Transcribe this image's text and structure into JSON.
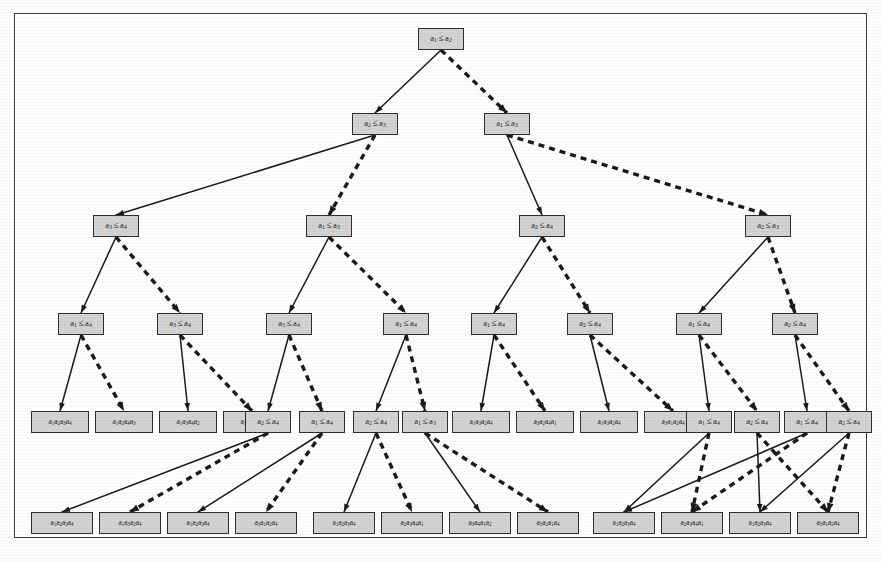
{
  "figure": {
    "type": "sorting-decision-tree",
    "element_symbol": "a",
    "colors": {
      "node_fill": "#d2d2d2",
      "node_border": "#2e2e2e",
      "edge_solid": "#1a1a1a",
      "edge_dashed": "#1a1a1a",
      "frame": "#3a3a3a",
      "page": "#fefefe"
    },
    "edge_legend": {
      "solid": "comparison true (yes) branch",
      "dashed": "comparison false (no) branch"
    },
    "levels": 6
  },
  "nodes": [
    {
      "id": "n0",
      "kind": "decision",
      "level": 0,
      "x": 418,
      "y": 28,
      "w": 46,
      "h": 22,
      "left": "a",
      "li": "1",
      "right": "a",
      "ri": "2"
    },
    {
      "id": "n1",
      "kind": "decision",
      "level": 1,
      "x": 352,
      "y": 113,
      "w": 46,
      "h": 22,
      "left": "a",
      "li": "2",
      "right": "a",
      "ri": "3"
    },
    {
      "id": "n2",
      "kind": "decision",
      "level": 1,
      "x": 484,
      "y": 113,
      "w": 46,
      "h": 22,
      "left": "a",
      "li": "1",
      "right": "a",
      "ri": "3"
    },
    {
      "id": "n3",
      "kind": "decision",
      "level": 2,
      "x": 93,
      "y": 215,
      "w": 46,
      "h": 22,
      "left": "a",
      "li": "3",
      "right": "a",
      "ri": "4"
    },
    {
      "id": "n4",
      "kind": "decision",
      "level": 2,
      "x": 306,
      "y": 215,
      "w": 46,
      "h": 22,
      "left": "a",
      "li": "1",
      "right": "a",
      "ri": "3"
    },
    {
      "id": "n5",
      "kind": "decision",
      "level": 2,
      "x": 519,
      "y": 215,
      "w": 46,
      "h": 22,
      "left": "a",
      "li": "2",
      "right": "a",
      "ri": "4"
    },
    {
      "id": "n6",
      "kind": "decision",
      "level": 2,
      "x": 745,
      "y": 215,
      "w": 46,
      "h": 22,
      "left": "a",
      "li": "2",
      "right": "a",
      "ri": "3"
    },
    {
      "id": "n7",
      "kind": "decision",
      "level": 3,
      "x": 58,
      "y": 313,
      "w": 46,
      "h": 22,
      "left": "a",
      "li": "1",
      "right": "a",
      "ri": "4"
    },
    {
      "id": "n8",
      "kind": "decision",
      "level": 3,
      "x": 157,
      "y": 313,
      "w": 46,
      "h": 22,
      "left": "a",
      "li": "3",
      "right": "a",
      "ri": "4"
    },
    {
      "id": "n9",
      "kind": "decision",
      "level": 3,
      "x": 266,
      "y": 313,
      "w": 46,
      "h": 22,
      "left": "a",
      "li": "3",
      "right": "a",
      "ri": "4"
    },
    {
      "id": "n10",
      "kind": "decision",
      "level": 3,
      "x": 383,
      "y": 313,
      "w": 46,
      "h": 22,
      "left": "a",
      "li": "1",
      "right": "a",
      "ri": "4"
    },
    {
      "id": "n11",
      "kind": "decision",
      "level": 3,
      "x": 471,
      "y": 313,
      "w": 46,
      "h": 22,
      "left": "a",
      "li": "1",
      "right": "a",
      "ri": "4"
    },
    {
      "id": "n12",
      "kind": "decision",
      "level": 3,
      "x": 567,
      "y": 313,
      "w": 46,
      "h": 22,
      "left": "a",
      "li": "2",
      "right": "a",
      "ri": "4"
    },
    {
      "id": "n13",
      "kind": "decision",
      "level": 3,
      "x": 676,
      "y": 313,
      "w": 46,
      "h": 22,
      "left": "a",
      "li": "1",
      "right": "a",
      "ri": "4"
    },
    {
      "id": "n14",
      "kind": "decision",
      "level": 3,
      "x": 772,
      "y": 313,
      "w": 46,
      "h": 22,
      "left": "a",
      "li": "2",
      "right": "a",
      "ri": "4"
    },
    {
      "id": "L1",
      "kind": "leaf",
      "level": 4,
      "x": 31,
      "y": 411,
      "w": 58,
      "h": 22,
      "perm": [
        "1",
        "2",
        "3",
        "4"
      ]
    },
    {
      "id": "L2",
      "kind": "leaf",
      "level": 4,
      "x": 95,
      "y": 411,
      "w": 58,
      "h": 22,
      "perm": [
        "1",
        "2",
        "4",
        "3"
      ]
    },
    {
      "id": "L3",
      "kind": "leaf",
      "level": 4,
      "x": 159,
      "y": 411,
      "w": 58,
      "h": 22,
      "perm": [
        "1",
        "3",
        "4",
        "2"
      ]
    },
    {
      "id": "L4",
      "kind": "leaf",
      "level": 4,
      "x": 223,
      "y": 411,
      "w": 58,
      "h": 22,
      "perm": [
        "3",
        "4",
        "1",
        "2"
      ]
    },
    {
      "id": "n15",
      "kind": "decision",
      "level": 4,
      "x": 245,
      "y": 411,
      "w": 46,
      "h": 22,
      "left": "a",
      "li": "2",
      "right": "a",
      "ri": "4"
    },
    {
      "id": "n16",
      "kind": "decision",
      "level": 4,
      "x": 299,
      "y": 411,
      "w": 46,
      "h": 22,
      "left": "a",
      "li": "1",
      "right": "a",
      "ri": "4"
    },
    {
      "id": "n17",
      "kind": "decision",
      "level": 4,
      "x": 353,
      "y": 411,
      "w": 46,
      "h": 22,
      "left": "a",
      "li": "2",
      "right": "a",
      "ri": "4"
    },
    {
      "id": "n18",
      "kind": "decision",
      "level": 4,
      "x": 402,
      "y": 411,
      "w": 46,
      "h": 22,
      "left": "a",
      "li": "1",
      "right": "a",
      "ri": "3"
    },
    {
      "id": "L5",
      "kind": "leaf",
      "level": 4,
      "x": 452,
      "y": 411,
      "w": 58,
      "h": 22,
      "perm": [
        "1",
        "3",
        "2",
        "4"
      ]
    },
    {
      "id": "L6",
      "kind": "leaf",
      "level": 4,
      "x": 516,
      "y": 411,
      "w": 58,
      "h": 22,
      "perm": [
        "3",
        "2",
        "4",
        "1"
      ]
    },
    {
      "id": "L7",
      "kind": "leaf",
      "level": 4,
      "x": 580,
      "y": 411,
      "w": 58,
      "h": 22,
      "perm": [
        "1",
        "3",
        "2",
        "4"
      ]
    },
    {
      "id": "L8",
      "kind": "leaf",
      "level": 4,
      "x": 644,
      "y": 411,
      "w": 58,
      "h": 22,
      "perm": [
        "3",
        "1",
        "2",
        "4"
      ]
    },
    {
      "id": "n19",
      "kind": "decision",
      "level": 4,
      "x": 686,
      "y": 411,
      "w": 46,
      "h": 22,
      "left": "a",
      "li": "1",
      "right": "a",
      "ri": "4"
    },
    {
      "id": "n20",
      "kind": "decision",
      "level": 4,
      "x": 734,
      "y": 411,
      "w": 46,
      "h": 22,
      "left": "a",
      "li": "2",
      "right": "a",
      "ri": "4"
    },
    {
      "id": "n21",
      "kind": "decision",
      "level": 4,
      "x": 784,
      "y": 411,
      "w": 46,
      "h": 22,
      "left": "a",
      "li": "1",
      "right": "a",
      "ri": "4"
    },
    {
      "id": "n22",
      "kind": "decision",
      "level": 4,
      "x": 826,
      "y": 411,
      "w": 46,
      "h": 22,
      "left": "a",
      "li": "2",
      "right": "a",
      "ri": "4"
    },
    {
      "id": "M1",
      "kind": "leaf",
      "level": 5,
      "x": 31,
      "y": 512,
      "w": 62,
      "h": 22,
      "perm": [
        "1",
        "2",
        "3",
        "4"
      ]
    },
    {
      "id": "M2",
      "kind": "leaf",
      "level": 5,
      "x": 99,
      "y": 512,
      "w": 62,
      "h": 22,
      "perm": [
        "1",
        "3",
        "2",
        "4"
      ]
    },
    {
      "id": "M3",
      "kind": "leaf",
      "level": 5,
      "x": 167,
      "y": 512,
      "w": 62,
      "h": 22,
      "perm": [
        "1",
        "2",
        "3",
        "4"
      ]
    },
    {
      "id": "M4",
      "kind": "leaf",
      "level": 5,
      "x": 235,
      "y": 512,
      "w": 62,
      "h": 22,
      "perm": [
        "3",
        "1",
        "2",
        "4"
      ]
    },
    {
      "id": "M5",
      "kind": "leaf",
      "level": 5,
      "x": 313,
      "y": 512,
      "w": 62,
      "h": 22,
      "perm": [
        "1",
        "2",
        "3",
        "4"
      ]
    },
    {
      "id": "M6",
      "kind": "leaf",
      "level": 5,
      "x": 381,
      "y": 512,
      "w": 62,
      "h": 22,
      "perm": [
        "2",
        "3",
        "4",
        "1"
      ]
    },
    {
      "id": "M7",
      "kind": "leaf",
      "level": 5,
      "x": 449,
      "y": 512,
      "w": 62,
      "h": 22,
      "perm": [
        "3",
        "4",
        "1",
        "2"
      ]
    },
    {
      "id": "M8",
      "kind": "leaf",
      "level": 5,
      "x": 517,
      "y": 512,
      "w": 62,
      "h": 22,
      "perm": [
        "3",
        "2",
        "1",
        "4"
      ]
    },
    {
      "id": "M9",
      "kind": "leaf",
      "level": 5,
      "x": 593,
      "y": 512,
      "w": 62,
      "h": 22,
      "perm": [
        "1",
        "2",
        "3",
        "4"
      ]
    },
    {
      "id": "M10",
      "kind": "leaf",
      "level": 5,
      "x": 661,
      "y": 512,
      "w": 62,
      "h": 22,
      "perm": [
        "2",
        "3",
        "4",
        "1"
      ]
    },
    {
      "id": "M11",
      "kind": "leaf",
      "level": 5,
      "x": 729,
      "y": 512,
      "w": 62,
      "h": 22,
      "perm": [
        "1",
        "2",
        "3",
        "4"
      ]
    },
    {
      "id": "M12",
      "kind": "leaf",
      "level": 5,
      "x": 797,
      "y": 512,
      "w": 62,
      "h": 22,
      "perm": [
        "3",
        "1",
        "2",
        "4"
      ]
    }
  ],
  "edges": [
    {
      "from": "n0",
      "to": "n1",
      "style": "solid"
    },
    {
      "from": "n0",
      "to": "n2",
      "style": "dashed"
    },
    {
      "from": "n1",
      "to": "n3",
      "style": "solid"
    },
    {
      "from": "n1",
      "to": "n4",
      "style": "dashed"
    },
    {
      "from": "n2",
      "to": "n5",
      "style": "solid"
    },
    {
      "from": "n2",
      "to": "n6",
      "style": "dashed"
    },
    {
      "from": "n3",
      "to": "n7",
      "style": "solid"
    },
    {
      "from": "n3",
      "to": "n8",
      "style": "dashed"
    },
    {
      "from": "n4",
      "to": "n9",
      "style": "solid"
    },
    {
      "from": "n4",
      "to": "n10",
      "style": "dashed"
    },
    {
      "from": "n5",
      "to": "n11",
      "style": "solid"
    },
    {
      "from": "n5",
      "to": "n12",
      "style": "dashed"
    },
    {
      "from": "n6",
      "to": "n13",
      "style": "solid"
    },
    {
      "from": "n6",
      "to": "n14",
      "style": "dashed"
    },
    {
      "from": "n7",
      "to": "L1",
      "style": "solid"
    },
    {
      "from": "n7",
      "to": "L2",
      "style": "dashed"
    },
    {
      "from": "n8",
      "to": "L3",
      "style": "solid"
    },
    {
      "from": "n8",
      "to": "L4",
      "style": "dashed"
    },
    {
      "from": "n9",
      "to": "n15",
      "style": "solid"
    },
    {
      "from": "n9",
      "to": "n16",
      "style": "dashed"
    },
    {
      "from": "n10",
      "to": "n17",
      "style": "solid"
    },
    {
      "from": "n10",
      "to": "n18",
      "style": "dashed"
    },
    {
      "from": "n11",
      "to": "L5",
      "style": "solid"
    },
    {
      "from": "n11",
      "to": "L6",
      "style": "dashed"
    },
    {
      "from": "n12",
      "to": "L7",
      "style": "solid"
    },
    {
      "from": "n12",
      "to": "L8",
      "style": "dashed"
    },
    {
      "from": "n13",
      "to": "n19",
      "style": "solid"
    },
    {
      "from": "n13",
      "to": "n20",
      "style": "dashed"
    },
    {
      "from": "n14",
      "to": "n21",
      "style": "solid"
    },
    {
      "from": "n14",
      "to": "n22",
      "style": "dashed"
    },
    {
      "from": "n15",
      "to": "M1",
      "style": "solid"
    },
    {
      "from": "n15",
      "to": "M2",
      "style": "dashed"
    },
    {
      "from": "n16",
      "to": "M3",
      "style": "solid"
    },
    {
      "from": "n16",
      "to": "M4",
      "style": "dashed"
    },
    {
      "from": "n17",
      "to": "M5",
      "style": "solid"
    },
    {
      "from": "n17",
      "to": "M6",
      "style": "dashed"
    },
    {
      "from": "n18",
      "to": "M7",
      "style": "solid"
    },
    {
      "from": "n18",
      "to": "M8",
      "style": "dashed"
    },
    {
      "from": "n19",
      "to": "M9",
      "style": "solid"
    },
    {
      "from": "n19",
      "to": "M10",
      "style": "dashed"
    },
    {
      "from": "n20",
      "to": "M11",
      "style": "solid"
    },
    {
      "from": "n20",
      "to": "M12",
      "style": "dashed"
    },
    {
      "from": "n21",
      "to": "M9",
      "style": "solid"
    },
    {
      "from": "n21",
      "to": "M10",
      "style": "dashed"
    },
    {
      "from": "n22",
      "to": "M11",
      "style": "solid"
    },
    {
      "from": "n22",
      "to": "M12",
      "style": "dashed"
    }
  ]
}
